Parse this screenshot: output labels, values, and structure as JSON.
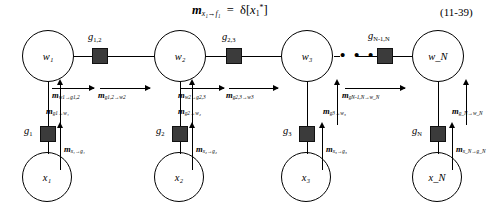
{
  "equation": {
    "lhs_m": "m",
    "lhs_sub": "x₁→f₁",
    "eq": "=",
    "rhs": "δ[",
    "rhs_var": "x",
    "rhs_sub": "1",
    "rhs_sup": "*",
    "rhs_close": "]",
    "number": "(11-39)"
  },
  "nodes": {
    "w": [
      {
        "label": "w₁"
      },
      {
        "label": "w₂"
      },
      {
        "label": "w₃"
      },
      {
        "label": "w_N"
      }
    ],
    "x": [
      {
        "label": "x₁"
      },
      {
        "label": "x₂"
      },
      {
        "label": "x₃"
      },
      {
        "label": "x_N"
      }
    ]
  },
  "factors": {
    "pairwise": [
      {
        "label_base": "g",
        "label_sub": "1,2"
      },
      {
        "label_base": "g",
        "label_sub": "2,3"
      },
      {
        "label_base": "g",
        "label_sub": "N-1,N"
      }
    ],
    "local": [
      {
        "label_base": "g",
        "label_sub": "1"
      },
      {
        "label_base": "g",
        "label_sub": "2"
      },
      {
        "label_base": "g",
        "label_sub": "3"
      },
      {
        "label_base": "g",
        "label_sub": "N"
      }
    ]
  },
  "messages": {
    "w_to_g": [
      {
        "m": "m",
        "sub": "w1→g1,2"
      },
      {
        "m": "m",
        "sub": "w2→g2,3"
      }
    ],
    "g_to_w": [
      {
        "m": "m",
        "sub": "g1,2→w2"
      },
      {
        "m": "m",
        "sub": "g2,3→w3"
      },
      {
        "m": "m",
        "sub": "gN-1,N→w_N"
      }
    ],
    "gl_to_w": [
      {
        "m": "m",
        "sub": "g1→w₁"
      },
      {
        "m": "m",
        "sub": "g2→w₂"
      },
      {
        "m": "m",
        "sub": "g3→w₃"
      },
      {
        "m": "m",
        "sub": "g_N→w_N"
      }
    ],
    "x_to_g": [
      {
        "m": "m",
        "sub": "x₁→g₁"
      },
      {
        "m": "m",
        "sub": "x₂→g₂"
      },
      {
        "m": "m",
        "sub": "x₃→g₃"
      },
      {
        "m": "m",
        "sub": "x_N→g_N"
      }
    ]
  },
  "ellipsis": "• • •"
}
